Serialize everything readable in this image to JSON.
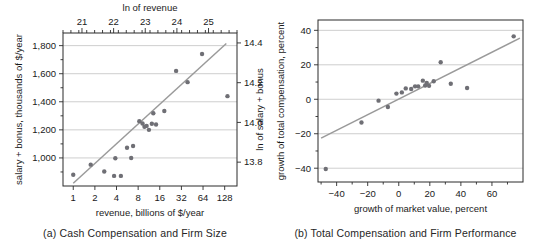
{
  "figure": {
    "panel_a_caption": "(a) Cash Compensation and Firm Size",
    "panel_b_caption": "(b) Total Compensation and Firm Performance"
  },
  "chart_data": [
    {
      "id": "panel-a",
      "type": "scatter",
      "title": "",
      "caption": "(a) Cash Compensation and Firm Size",
      "xlabel": "revenue, billions of $/year",
      "ylabel": "salary + bonus, thousands of $/year",
      "top_axis_label": "ln of revenue",
      "right_axis_label": "ln of salary + bonus",
      "xscale": "log2",
      "xlim": [
        0.72,
        190
      ],
      "ylim": [
        800,
        1890
      ],
      "xticks": [
        1,
        2,
        4,
        8,
        16,
        32,
        64,
        128
      ],
      "xticklabels": [
        "1",
        "2",
        "4",
        "8",
        "16",
        "32",
        "64",
        "128"
      ],
      "yticks": [
        1000,
        1200,
        1400,
        1600,
        1800
      ],
      "yticklabels": [
        "1,000",
        "1,200",
        "1,400",
        "1,600",
        "1,800"
      ],
      "top_ticks": [
        21,
        22,
        23,
        24,
        25
      ],
      "top_ticklabels": [
        "21",
        "22",
        "23",
        "24",
        "25"
      ],
      "top_lim": [
        20.4,
        25.9
      ],
      "right_ticks": [
        13.8,
        14.0,
        14.2,
        14.4
      ],
      "right_ticklabels": [
        "13.8",
        "14.0",
        "14.2",
        "14.4"
      ],
      "right_lim": [
        13.68,
        14.45
      ],
      "grid": "horizontal",
      "legend": "none",
      "points": [
        {
          "x": 1.0,
          "y": 880
        },
        {
          "x": 1.75,
          "y": 952
        },
        {
          "x": 2.7,
          "y": 903
        },
        {
          "x": 3.7,
          "y": 872
        },
        {
          "x": 3.85,
          "y": 998
        },
        {
          "x": 4.6,
          "y": 872
        },
        {
          "x": 5.6,
          "y": 1073
        },
        {
          "x": 6.4,
          "y": 1000
        },
        {
          "x": 6.8,
          "y": 1085
        },
        {
          "x": 8.3,
          "y": 1262
        },
        {
          "x": 9.2,
          "y": 1245
        },
        {
          "x": 9.8,
          "y": 1222
        },
        {
          "x": 10.5,
          "y": 1228
        },
        {
          "x": 11.3,
          "y": 1200
        },
        {
          "x": 12.4,
          "y": 1243
        },
        {
          "x": 13.0,
          "y": 1318
        },
        {
          "x": 14.2,
          "y": 1238
        },
        {
          "x": 18.5,
          "y": 1334
        },
        {
          "x": 27.0,
          "y": 1620
        },
        {
          "x": 39.0,
          "y": 1540
        },
        {
          "x": 62.0,
          "y": 1740
        },
        {
          "x": 140.0,
          "y": 1440
        }
      ],
      "fit_line": {
        "x1": 1.0,
        "y1": 820,
        "x2": 135.0,
        "y2": 1815
      }
    },
    {
      "id": "panel-b",
      "type": "scatter",
      "title": "",
      "caption": "(b) Total Compensation and Firm Performance",
      "xlabel": "growth of market value, percent",
      "ylabel": "growth of total compensation, percent",
      "xscale": "linear",
      "xlim": [
        -52,
        80
      ],
      "ylim": [
        -48,
        46
      ],
      "xticks": [
        -40,
        -20,
        0,
        20,
        40,
        60
      ],
      "xticklabels": [
        "−40",
        "−20",
        "0",
        "20",
        "40",
        "60"
      ],
      "yticks": [
        -40,
        -20,
        0,
        20,
        40
      ],
      "yticklabels": [
        "−40",
        "−20",
        "0",
        "20",
        "40"
      ],
      "grid": "horizontal",
      "legend": "none",
      "points": [
        {
          "x": -47.0,
          "y": -40.5
        },
        {
          "x": -24.0,
          "y": -13.5
        },
        {
          "x": -13.0,
          "y": -0.8
        },
        {
          "x": -7.0,
          "y": -4.5
        },
        {
          "x": -1.5,
          "y": 3.3
        },
        {
          "x": 2.0,
          "y": 4.0
        },
        {
          "x": 4.5,
          "y": 6.3
        },
        {
          "x": 8.0,
          "y": 6.0
        },
        {
          "x": 10.5,
          "y": 7.5
        },
        {
          "x": 12.5,
          "y": 7.5
        },
        {
          "x": 15.5,
          "y": 10.8
        },
        {
          "x": 17.0,
          "y": 8.0
        },
        {
          "x": 18.0,
          "y": 9.5
        },
        {
          "x": 19.5,
          "y": 7.8
        },
        {
          "x": 22.5,
          "y": 10.5
        },
        {
          "x": 27.0,
          "y": 21.5
        },
        {
          "x": 33.5,
          "y": 9.0
        },
        {
          "x": 44.0,
          "y": 6.5
        },
        {
          "x": 74.0,
          "y": 36.5
        }
      ],
      "fit_line": {
        "x1": -50.0,
        "y1": -22.5,
        "x2": 78.0,
        "y2": 35.5
      }
    }
  ]
}
